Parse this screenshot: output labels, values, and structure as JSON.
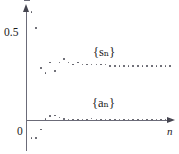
{
  "figure": {
    "axes": {
      "y_tick_label": "0.5",
      "origin_label": "0",
      "x_axis_label": "n"
    },
    "series_labels": {
      "upper": "{sₙ}",
      "lower": "{aₙ}"
    }
  },
  "chart_data": {
    "type": "scatter",
    "title": "",
    "xlabel": "n",
    "ylabel": "",
    "grid": false,
    "legend": "inline-annotation",
    "xlim": [
      0,
      32
    ],
    "ylim": [
      -0.14,
      0.66
    ],
    "yticks": [
      0,
      0.5
    ],
    "ytick_labels": [
      "0",
      "0.5"
    ],
    "annotations": [
      {
        "text": "{s_n}",
        "x": 14.8,
        "y": 0.39
      },
      {
        "text": "{a_n}",
        "x": 14.6,
        "y": 0.115
      }
    ],
    "series": [
      {
        "name": "{s_n}",
        "x": [
          1,
          2,
          3,
          4,
          5,
          6,
          7,
          8,
          9,
          10,
          11,
          12,
          13,
          14,
          15,
          16,
          17,
          18,
          19,
          20,
          21,
          22,
          23,
          24,
          25,
          26,
          27,
          28,
          29,
          30,
          31
        ],
        "values": [
          0.62,
          0.53,
          0.3,
          0.27,
          0.33,
          0.28,
          0.33,
          0.35,
          0.33,
          0.32,
          0.33,
          0.32,
          0.32,
          0.32,
          0.32,
          0.32,
          0.32,
          0.31,
          0.31,
          0.31,
          0.31,
          0.31,
          0.31,
          0.31,
          0.31,
          0.31,
          0.31,
          0.31,
          0.31,
          0.31,
          0.31
        ]
      },
      {
        "name": "{a_n}",
        "x": [
          1,
          2,
          3,
          4,
          5,
          6,
          7,
          8,
          9,
          10,
          11,
          12,
          13,
          14,
          15,
          16,
          17,
          18,
          19,
          20,
          21,
          22,
          23,
          24,
          25,
          26,
          27,
          28,
          29,
          30,
          31
        ],
        "values": [
          -0.105,
          -0.105,
          -0.055,
          0.006,
          0.022,
          0.026,
          0.015,
          0.007,
          0.003,
          0.003,
          0.002,
          0.002,
          0.002,
          0.009,
          0.002,
          0.002,
          0.002,
          0.002,
          0.002,
          0.002,
          0.002,
          0.002,
          0.002,
          0.002,
          0.002,
          0.002,
          0.002,
          0.002,
          0.002,
          0.002,
          0.002
        ]
      }
    ]
  }
}
